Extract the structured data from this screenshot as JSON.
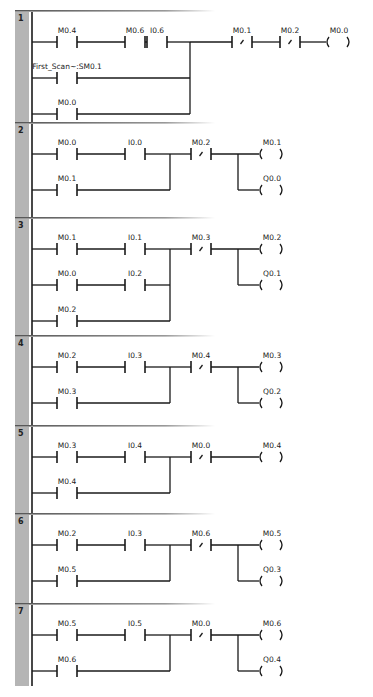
{
  "program": {
    "networks": [
      {
        "number": "1",
        "rows": [
          {
            "contacts": [
              {
                "label": "M0.4",
                "type": "NO"
              },
              {
                "label": "M0.6",
                "type": "NO"
              },
              {
                "label": "I0.6",
                "type": "NO"
              }
            ]
          },
          {
            "contacts": [
              {
                "label": "First_Scan~:SM0.1",
                "type": "NO"
              }
            ]
          },
          {
            "contacts": [
              {
                "label": "M0.0",
                "type": "NO"
              }
            ]
          }
        ],
        "series": [
          {
            "label": "M0.1",
            "type": "NC"
          },
          {
            "label": "M0.2",
            "type": "NC"
          }
        ],
        "coils": [
          {
            "label": "M0.0"
          }
        ]
      },
      {
        "number": "2",
        "rows": [
          {
            "contacts": [
              {
                "label": "M0.0",
                "type": "NO"
              },
              {
                "label": "I0.0",
                "type": "NO"
              }
            ]
          },
          {
            "contacts": [
              {
                "label": "M0.1",
                "type": "NO"
              }
            ]
          }
        ],
        "series": [
          {
            "label": "M0.2",
            "type": "NC"
          }
        ],
        "coils": [
          {
            "label": "M0.1"
          },
          {
            "label": "Q0.0"
          }
        ]
      },
      {
        "number": "3",
        "rows": [
          {
            "contacts": [
              {
                "label": "M0.1",
                "type": "NO"
              },
              {
                "label": "I0.1",
                "type": "NO"
              }
            ]
          },
          {
            "contacts": [
              {
                "label": "M0.0",
                "type": "NO"
              },
              {
                "label": "I0.2",
                "type": "NO"
              }
            ]
          },
          {
            "contacts": [
              {
                "label": "M0.2",
                "type": "NO"
              }
            ]
          }
        ],
        "series": [
          {
            "label": "M0.3",
            "type": "NC"
          }
        ],
        "coils": [
          {
            "label": "M0.2"
          },
          {
            "label": "Q0.1"
          }
        ]
      },
      {
        "number": "4",
        "rows": [
          {
            "contacts": [
              {
                "label": "M0.2",
                "type": "NO"
              },
              {
                "label": "I0.3",
                "type": "NO"
              }
            ]
          },
          {
            "contacts": [
              {
                "label": "M0.3",
                "type": "NO"
              }
            ]
          }
        ],
        "series": [
          {
            "label": "M0.4",
            "type": "NC"
          }
        ],
        "coils": [
          {
            "label": "M0.3"
          },
          {
            "label": "Q0.2"
          }
        ]
      },
      {
        "number": "5",
        "rows": [
          {
            "contacts": [
              {
                "label": "M0.3",
                "type": "NO"
              },
              {
                "label": "I0.4",
                "type": "NO"
              }
            ]
          },
          {
            "contacts": [
              {
                "label": "M0.4",
                "type": "NO"
              }
            ]
          }
        ],
        "series": [
          {
            "label": "M0.0",
            "type": "NC"
          }
        ],
        "coils": [
          {
            "label": "M0.4"
          }
        ]
      },
      {
        "number": "6",
        "rows": [
          {
            "contacts": [
              {
                "label": "M0.2",
                "type": "NO"
              },
              {
                "label": "I0.3",
                "type": "NO"
              }
            ]
          },
          {
            "contacts": [
              {
                "label": "M0.5",
                "type": "NO"
              }
            ]
          }
        ],
        "series": [
          {
            "label": "M0.6",
            "type": "NC"
          }
        ],
        "coils": [
          {
            "label": "M0.5"
          },
          {
            "label": "Q0.3"
          }
        ]
      },
      {
        "number": "7",
        "rows": [
          {
            "contacts": [
              {
                "label": "M0.5",
                "type": "NO"
              },
              {
                "label": "I0.5",
                "type": "NO"
              }
            ]
          },
          {
            "contacts": [
              {
                "label": "M0.6",
                "type": "NO"
              }
            ]
          }
        ],
        "series": [
          {
            "label": "M0.0",
            "type": "NC"
          }
        ],
        "coils": [
          {
            "label": "M0.6"
          },
          {
            "label": "Q0.4"
          }
        ]
      }
    ]
  }
}
